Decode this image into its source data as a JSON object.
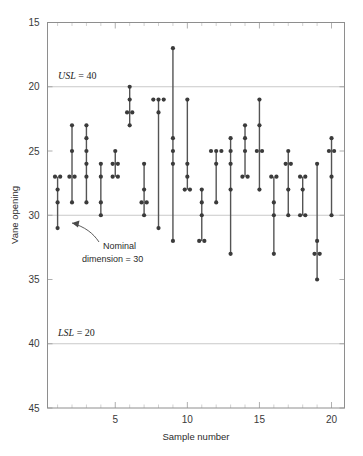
{
  "chart_data": {
    "type": "scatter",
    "title": "",
    "xlabel": "Sample number",
    "ylabel": "Vane opening",
    "xlim": [
      0.3,
      20.9
    ],
    "ylim": [
      15,
      45
    ],
    "yticks": [
      15,
      20,
      25,
      30,
      35,
      40,
      45
    ],
    "xticks": [
      5,
      10,
      15,
      20
    ],
    "grid": "horizontal-at-reference-lines",
    "legend": "none",
    "point_color": "#3b3b3b",
    "stem_color": "#545454",
    "gridline_color": "#c9c9c9",
    "reference_lines": [
      {
        "name": "USL",
        "label": "USL = 40",
        "value": 40
      },
      {
        "name": "Nominal",
        "label": "Nominal dimension = 30",
        "value": 30
      },
      {
        "name": "LSL",
        "label": "LSL = 20",
        "value": 20
      }
    ],
    "annotations": [
      {
        "text_line1": "Nominal",
        "text_line2": "dimension = 30",
        "points_to_sample": 2,
        "points_to_value": 30
      }
    ],
    "categories": [
      1,
      2,
      3,
      4,
      5,
      6,
      7,
      8,
      9,
      10,
      11,
      12,
      13,
      14,
      15,
      16,
      17,
      18,
      19,
      20
    ],
    "samples": [
      {
        "sample": 1,
        "values": [
          33,
          32,
          31,
          33,
          29
        ]
      },
      {
        "sample": 2,
        "values": [
          33,
          33,
          35,
          37,
          31
        ]
      },
      {
        "sample": 3,
        "values": [
          31,
          33,
          34,
          36,
          35,
          37
        ]
      },
      {
        "sample": 4,
        "values": [
          34,
          31,
          30,
          33
        ]
      },
      {
        "sample": 5,
        "values": [
          33,
          34,
          35,
          34,
          33
        ]
      },
      {
        "sample": 6,
        "values": [
          38,
          39,
          40,
          37,
          38
        ]
      },
      {
        "sample": 7,
        "values": [
          31,
          32,
          34,
          30,
          31
        ]
      },
      {
        "sample": 8,
        "values": [
          39,
          38,
          29,
          39,
          39
        ]
      },
      {
        "sample": 9,
        "values": [
          43,
          36,
          35,
          34,
          28
        ]
      },
      {
        "sample": 10,
        "values": [
          39,
          34,
          33,
          32,
          32
        ]
      },
      {
        "sample": 11,
        "values": [
          32,
          31,
          30,
          28,
          28
        ]
      },
      {
        "sample": 12,
        "values": [
          35,
          34,
          35,
          31,
          35
        ]
      },
      {
        "sample": 13,
        "values": [
          36,
          35,
          34,
          32,
          27
        ]
      },
      {
        "sample": 14,
        "values": [
          37,
          36,
          35,
          33,
          33
        ]
      },
      {
        "sample": 15,
        "values": [
          39,
          37,
          35,
          35,
          32
        ]
      },
      {
        "sample": 16,
        "values": [
          33,
          33,
          31,
          30,
          27
        ]
      },
      {
        "sample": 17,
        "values": [
          35,
          34,
          34,
          32,
          30
        ]
      },
      {
        "sample": 18,
        "values": [
          33,
          33,
          32,
          30,
          30
        ]
      },
      {
        "sample": 19,
        "values": [
          34,
          28,
          27,
          27,
          25
        ]
      },
      {
        "sample": 20,
        "values": [
          36,
          35,
          35,
          33,
          30
        ]
      }
    ]
  },
  "axes": {
    "ylabel": "Vane opening",
    "xlabel": "Sample number",
    "ytick_labels": [
      "45",
      "40",
      "35",
      "30",
      "25",
      "20",
      "15"
    ],
    "xtick_labels": [
      "5",
      "10",
      "15",
      "20"
    ]
  },
  "labels": {
    "usl_italic": "USL",
    "usl_value": " = 40",
    "lsl_italic": "LSL",
    "lsl_value": " = 20",
    "nominal_line1": "Nominal",
    "nominal_line2": "dimension = 30"
  }
}
